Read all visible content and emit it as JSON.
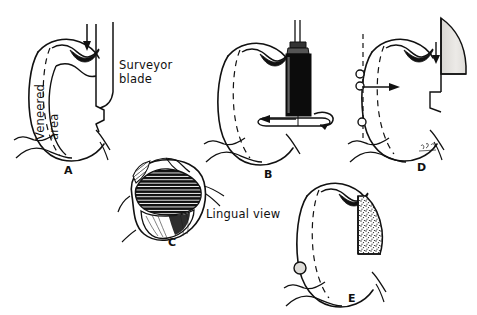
{
  "figure": {
    "background_color": "#ffffff",
    "ink_color": "#101010",
    "shade_light_color": "#e3e1de",
    "stipple_color": "#efedea",
    "width": 477,
    "height": 315
  },
  "panels": [
    {
      "id": "A",
      "label": "A",
      "label_x": 64,
      "label_y": 164,
      "description": "Proximal view of tooth with surveyor blade aligned vertically and downward arrow"
    },
    {
      "id": "B",
      "label": "B",
      "label_x": 264,
      "label_y": 168,
      "description": "Tooth with rotating handpiece cylinder and leftward arrow"
    },
    {
      "id": "C",
      "label": "C",
      "label_x": 168,
      "label_y": 236,
      "description": "Occlusal outline with hatched veneer region"
    },
    {
      "id": "D",
      "label": "D",
      "label_x": 417,
      "label_y": 161,
      "description": "Tooth with undercut gauge circles, dashed path of insertion and shaded blade"
    },
    {
      "id": "E",
      "label": "E",
      "label_x": 348,
      "label_y": 292,
      "description": "Tooth with stippled prepared veneer area and retentive circle"
    }
  ],
  "annotations": [
    {
      "name": "veneered-area-label",
      "lines": [
        "Veneered",
        "area"
      ],
      "text": "Veneered area",
      "x": 33,
      "y": 140,
      "rotated": true
    },
    {
      "name": "surveyor-blade-label",
      "lines": [
        "Surveyor",
        "blade"
      ],
      "text": "Surveyor blade",
      "x": 119,
      "y": 58,
      "rotated": false
    },
    {
      "name": "lingual-view-label",
      "lines": [
        "Lingual view"
      ],
      "text": "Lingual view",
      "x": 206,
      "y": 207,
      "rotated": false
    }
  ],
  "artist_signature": {
    "text": "sig",
    "x": 424,
    "y": 146
  }
}
